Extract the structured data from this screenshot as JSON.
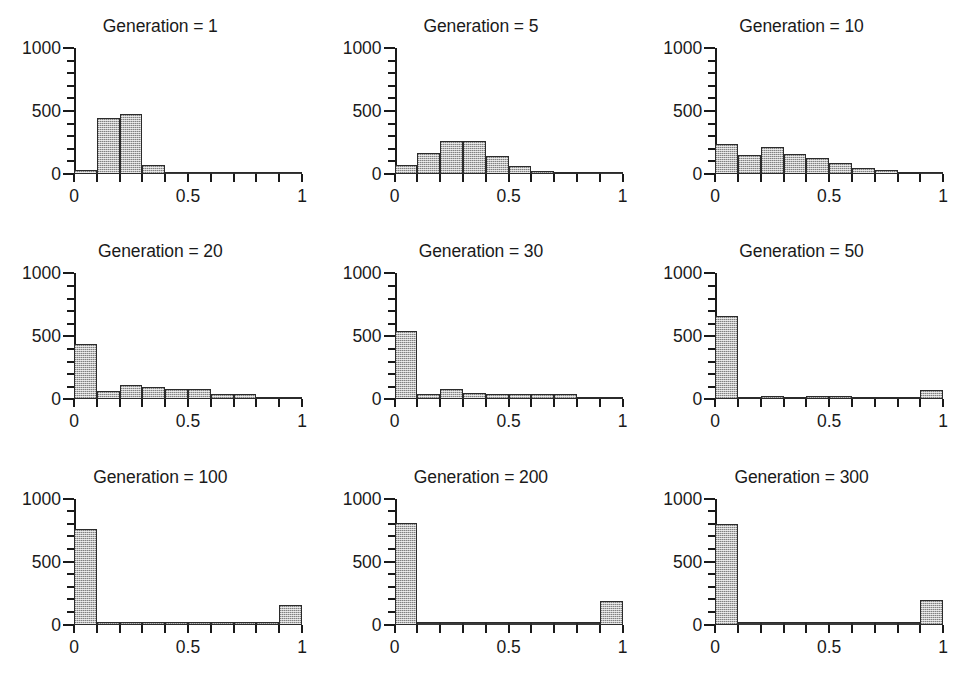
{
  "figure": {
    "kind": "small-multiples-histogram-grid",
    "rows": 3,
    "cols": 3,
    "background_color": "#ffffff",
    "bar_fill_color": "#b9b9b9",
    "bar_edge_color": "#2b2b2b",
    "axis_color": "#1a1a1a"
  },
  "axes": {
    "y_ticks_major": [
      0,
      500,
      1000
    ],
    "y_tick_labels": [
      "0",
      "500",
      "1000"
    ],
    "y_ticks_minor_step": 100,
    "y_min": 0,
    "y_max": 1000,
    "x_ticks": [
      0,
      0.1,
      0.2,
      0.3,
      0.4,
      0.5,
      0.6,
      0.7,
      0.8,
      0.9,
      1
    ],
    "x_tick_labels_shown": [
      "0",
      "0.5",
      "1"
    ],
    "x_labeled_positions": [
      0,
      0.5,
      1
    ],
    "x_min": 0,
    "x_max": 1,
    "bin_width": 0.1,
    "grid": false,
    "legend": false
  },
  "chart_data": [
    {
      "type": "bar",
      "title": "Generation = 1",
      "xlabel": "",
      "ylabel": "",
      "xlim": [
        0,
        1
      ],
      "ylim": [
        0,
        1000
      ],
      "bin_edges": [
        0,
        0.1,
        0.2,
        0.3,
        0.4,
        0.5,
        0.6,
        0.7,
        0.8,
        0.9,
        1.0
      ],
      "categories": [
        "0-0.1",
        "0.1-0.2",
        "0.2-0.3",
        "0.3-0.4",
        "0.4-0.5",
        "0.5-0.6",
        "0.6-0.7",
        "0.7-0.8",
        "0.8-0.9",
        "0.9-1.0"
      ],
      "values": [
        30,
        445,
        480,
        75,
        0,
        0,
        0,
        0,
        0,
        0
      ]
    },
    {
      "type": "bar",
      "title": "Generation = 5",
      "xlabel": "",
      "ylabel": "",
      "xlim": [
        0,
        1
      ],
      "ylim": [
        0,
        1000
      ],
      "bin_edges": [
        0,
        0.1,
        0.2,
        0.3,
        0.4,
        0.5,
        0.6,
        0.7,
        0.8,
        0.9,
        1.0
      ],
      "categories": [
        "0-0.1",
        "0.1-0.2",
        "0.2-0.3",
        "0.3-0.4",
        "0.4-0.5",
        "0.5-0.6",
        "0.6-0.7",
        "0.7-0.8",
        "0.8-0.9",
        "0.9-1.0"
      ],
      "values": [
        75,
        170,
        265,
        265,
        145,
        65,
        25,
        8,
        0,
        0
      ]
    },
    {
      "type": "bar",
      "title": "Generation = 10",
      "xlabel": "",
      "ylabel": "",
      "xlim": [
        0,
        1
      ],
      "ylim": [
        0,
        1000
      ],
      "bin_edges": [
        0,
        0.1,
        0.2,
        0.3,
        0.4,
        0.5,
        0.6,
        0.7,
        0.8,
        0.9,
        1.0
      ],
      "categories": [
        "0-0.1",
        "0.1-0.2",
        "0.2-0.3",
        "0.3-0.4",
        "0.4-0.5",
        "0.5-0.6",
        "0.6-0.7",
        "0.7-0.8",
        "0.8-0.9",
        "0.9-1.0"
      ],
      "values": [
        235,
        150,
        215,
        160,
        125,
        90,
        50,
        30,
        10,
        0
      ]
    },
    {
      "type": "bar",
      "title": "Generation = 20",
      "xlabel": "",
      "ylabel": "",
      "xlim": [
        0,
        1
      ],
      "ylim": [
        0,
        1000
      ],
      "bin_edges": [
        0,
        0.1,
        0.2,
        0.3,
        0.4,
        0.5,
        0.6,
        0.7,
        0.8,
        0.9,
        1.0
      ],
      "categories": [
        "0-0.1",
        "0.1-0.2",
        "0.2-0.3",
        "0.3-0.4",
        "0.4-0.5",
        "0.5-0.6",
        "0.6-0.7",
        "0.7-0.8",
        "0.8-0.9",
        "0.9-1.0"
      ],
      "values": [
        440,
        65,
        110,
        100,
        85,
        80,
        45,
        40,
        20,
        8
      ]
    },
    {
      "type": "bar",
      "title": "Generation = 30",
      "xlabel": "",
      "ylabel": "",
      "xlim": [
        0,
        1
      ],
      "ylim": [
        0,
        1000
      ],
      "bin_edges": [
        0,
        0.1,
        0.2,
        0.3,
        0.4,
        0.5,
        0.6,
        0.7,
        0.8,
        0.9,
        1.0
      ],
      "categories": [
        "0-0.1",
        "0.1-0.2",
        "0.2-0.3",
        "0.3-0.4",
        "0.4-0.5",
        "0.5-0.6",
        "0.6-0.7",
        "0.7-0.8",
        "0.8-0.9",
        "0.9-1.0"
      ],
      "values": [
        545,
        40,
        80,
        50,
        45,
        40,
        45,
        45,
        15,
        8
      ]
    },
    {
      "type": "bar",
      "title": "Generation = 50",
      "xlabel": "",
      "ylabel": "",
      "xlim": [
        0,
        1
      ],
      "ylim": [
        0,
        1000
      ],
      "bin_edges": [
        0,
        0.1,
        0.2,
        0.3,
        0.4,
        0.5,
        0.6,
        0.7,
        0.8,
        0.9,
        1.0
      ],
      "categories": [
        "0-0.1",
        "0.1-0.2",
        "0.2-0.3",
        "0.3-0.4",
        "0.4-0.5",
        "0.5-0.6",
        "0.6-0.7",
        "0.7-0.8",
        "0.8-0.9",
        "0.9-1.0"
      ],
      "values": [
        660,
        15,
        30,
        15,
        30,
        25,
        10,
        8,
        8,
        75
      ]
    },
    {
      "type": "bar",
      "title": "Generation = 100",
      "xlabel": "",
      "ylabel": "",
      "xlim": [
        0,
        1
      ],
      "ylim": [
        0,
        1000
      ],
      "bin_edges": [
        0,
        0.1,
        0.2,
        0.3,
        0.4,
        0.5,
        0.6,
        0.7,
        0.8,
        0.9,
        1.0
      ],
      "categories": [
        "0-0.1",
        "0.1-0.2",
        "0.2-0.3",
        "0.3-0.4",
        "0.4-0.5",
        "0.5-0.6",
        "0.6-0.7",
        "0.7-0.8",
        "0.8-0.9",
        "0.9-1.0"
      ],
      "values": [
        755,
        8,
        8,
        8,
        8,
        8,
        8,
        8,
        8,
        155
      ]
    },
    {
      "type": "bar",
      "title": "Generation = 200",
      "xlabel": "",
      "ylabel": "",
      "xlim": [
        0,
        1
      ],
      "ylim": [
        0,
        1000
      ],
      "bin_edges": [
        0,
        0.1,
        0.2,
        0.3,
        0.4,
        0.5,
        0.6,
        0.7,
        0.8,
        0.9,
        1.0
      ],
      "categories": [
        "0-0.1",
        "0.1-0.2",
        "0.2-0.3",
        "0.3-0.4",
        "0.4-0.5",
        "0.5-0.6",
        "0.6-0.7",
        "0.7-0.8",
        "0.8-0.9",
        "0.9-1.0"
      ],
      "values": [
        805,
        0,
        0,
        0,
        0,
        0,
        0,
        0,
        0,
        185
      ]
    },
    {
      "type": "bar",
      "title": "Generation = 300",
      "xlabel": "",
      "ylabel": "",
      "xlim": [
        0,
        1
      ],
      "ylim": [
        0,
        1000
      ],
      "bin_edges": [
        0,
        0.1,
        0.2,
        0.3,
        0.4,
        0.5,
        0.6,
        0.7,
        0.8,
        0.9,
        1.0
      ],
      "categories": [
        "0-0.1",
        "0.1-0.2",
        "0.2-0.3",
        "0.3-0.4",
        "0.4-0.5",
        "0.5-0.6",
        "0.6-0.7",
        "0.7-0.8",
        "0.8-0.9",
        "0.9-1.0"
      ],
      "values": [
        800,
        0,
        0,
        0,
        0,
        0,
        0,
        0,
        0,
        195
      ]
    }
  ]
}
